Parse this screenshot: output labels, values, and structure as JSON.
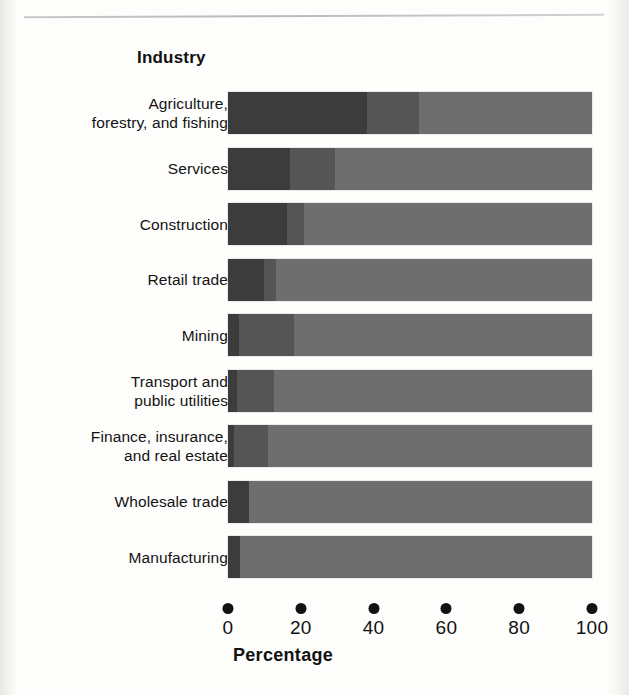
{
  "figure": {
    "category_axis_title": "Industry",
    "x_axis_title": "Percentage",
    "top_rule": "horizontal-rule"
  },
  "chart_data": {
    "type": "bar",
    "subtype": "stacked-horizontal-100",
    "title": "",
    "xlabel": "Percentage",
    "ylabel": "Industry",
    "xlim": [
      0,
      100
    ],
    "xticks": [
      0,
      20,
      40,
      60,
      80,
      100
    ],
    "xtick_labels": [
      "0",
      "20",
      "40",
      "60",
      "80",
      "100"
    ],
    "grid": false,
    "legend": null,
    "orientation": "horizontal",
    "categories": [
      "Agriculture,\nforestry, and fishing",
      "Services",
      "Construction",
      "Retail trade",
      "Mining",
      "Transport and\npublic utilities",
      "Finance, insurance,\nand real estate",
      "Wholesale trade",
      "Manufacturing"
    ],
    "series": [
      {
        "name": "segment-1",
        "color": "#3c3c3c",
        "values": [
          38.3,
          17.1,
          16.3,
          10.0,
          3.0,
          2.6,
          1.7,
          5.7,
          3.4
        ]
      },
      {
        "name": "segment-2",
        "color": "#555555",
        "values": [
          14.3,
          12.3,
          4.6,
          3.1,
          15.2,
          10.0,
          9.4,
          0.0,
          0.0
        ]
      },
      {
        "name": "segment-3",
        "color": "#6e6e6e",
        "values": [
          47.4,
          70.6,
          79.1,
          86.9,
          81.8,
          87.4,
          88.9,
          94.3,
          96.6
        ]
      }
    ],
    "colors": {
      "segment_1": "#3c3c3c",
      "segment_2": "#555555",
      "segment_3": "#6e6e6e",
      "text": "#121212",
      "background": "#fdfdfc"
    }
  }
}
